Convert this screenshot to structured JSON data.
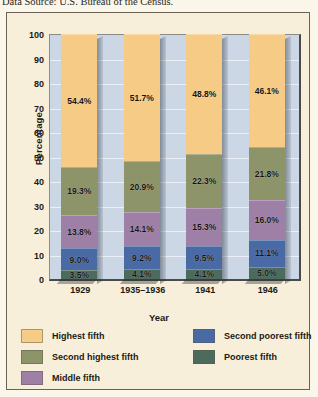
{
  "source_note": "Data Source: U.S. Bureau of the Census.",
  "chart_data": {
    "type": "bar",
    "stacked": true,
    "title": "",
    "xlabel": "Year",
    "ylabel": "Percentage",
    "ylim": [
      0,
      100
    ],
    "yticks": [
      0,
      10,
      20,
      30,
      40,
      50,
      60,
      70,
      80,
      90,
      100
    ],
    "grid": true,
    "legend_position": "bottom",
    "categories": [
      "1929",
      "1935–1936",
      "1941",
      "1946"
    ],
    "series": [
      {
        "name": "Poorest fifth",
        "color": "#4d6b5c",
        "values": [
          3.5,
          4.1,
          4.1,
          5.0
        ],
        "labels": [
          "3.5%",
          "4.1%",
          "4.1%",
          "5.0%"
        ]
      },
      {
        "name": "Second poorest fifth",
        "color": "#4a6aa5",
        "values": [
          9.0,
          9.2,
          9.5,
          11.1
        ],
        "labels": [
          "9.0%",
          "9.2%",
          "9.5%",
          "11.1%"
        ]
      },
      {
        "name": "Middle fifth",
        "color": "#9e7fa6",
        "values": [
          13.8,
          14.1,
          15.3,
          16.0
        ],
        "labels": [
          "13.8%",
          "14.1%",
          "15.3%",
          "16.0%"
        ]
      },
      {
        "name": "Second highest fifth",
        "color": "#8e9469",
        "values": [
          19.3,
          20.9,
          22.3,
          21.8
        ],
        "labels": [
          "19.3%",
          "20.9%",
          "22.3%",
          "21.8%"
        ]
      },
      {
        "name": "Highest fifth",
        "color": "#f5cb86",
        "values": [
          54.4,
          51.7,
          48.8,
          46.1
        ],
        "labels": [
          "54.4%",
          "51.7%",
          "48.8%",
          "46.1%"
        ]
      }
    ],
    "legend": [
      {
        "label": "Highest fifth",
        "color": "#f5cb86"
      },
      {
        "label": "Second highest fifth",
        "color": "#8e9469"
      },
      {
        "label": "Middle fifth",
        "color": "#9e7fa6"
      },
      {
        "label": "Second poorest fifth",
        "color": "#4a6aa5"
      },
      {
        "label": "Poorest fifth",
        "color": "#4d6b5c"
      }
    ],
    "plot_background": "#ccd7e6",
    "figure_background": "#f7efd9"
  }
}
